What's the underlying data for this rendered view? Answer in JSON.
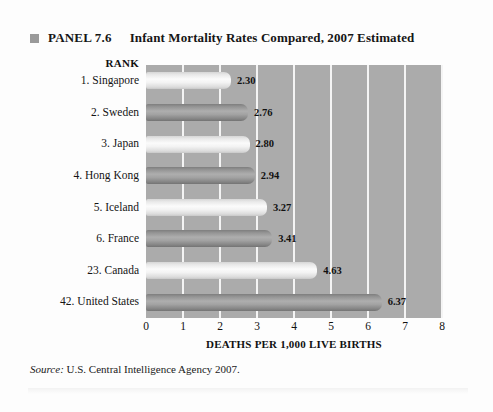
{
  "panel": {
    "bullet_icon": "square-bullet-icon",
    "label": "PANEL 7.6",
    "title": "Infant Mortality Rates Compared, 2007 Estimated"
  },
  "rank_header": "RANK",
  "source": {
    "label": "Source:",
    "text": "U.S. Central Intelligence Agency 2007."
  },
  "colors": {
    "plot_background": "#ababab",
    "gridline": "#f4f4f4",
    "bar_light": "#f3f3f3",
    "bar_dark": "#9a9a9a",
    "text": "#111111",
    "page_background": "#fdfdfd"
  },
  "chart_data": {
    "type": "bar",
    "orientation": "horizontal",
    "title": "Infant Mortality Rates Compared, 2007 Estimated",
    "xlabel": "DEATHS PER 1,000 LIVE BIRTHS",
    "ylabel": "RANK",
    "xlim": [
      0,
      8
    ],
    "xticks": [
      0,
      1,
      2,
      3,
      4,
      5,
      6,
      7,
      8
    ],
    "xtick_labels": [
      "0",
      "1",
      "2",
      "3",
      "4",
      "5",
      "6",
      "7",
      "8"
    ],
    "grid": "vertical",
    "legend": "none",
    "categories": [
      "1. Singapore",
      "2. Sweden",
      "3. Japan",
      "4. Hong Kong",
      "5. Iceland",
      "6. France",
      "23. Canada",
      "42. United States"
    ],
    "values": [
      2.3,
      2.76,
      2.8,
      2.94,
      3.27,
      3.41,
      4.63,
      6.37
    ],
    "value_labels": [
      "2.30",
      "2.76",
      "2.80",
      "2.94",
      "3.27",
      "3.41",
      "4.63",
      "6.37"
    ],
    "bar_styles": [
      "light",
      "dark",
      "light",
      "dark",
      "light",
      "dark",
      "light",
      "dark"
    ],
    "source": "U.S. Central Intelligence Agency 2007."
  }
}
